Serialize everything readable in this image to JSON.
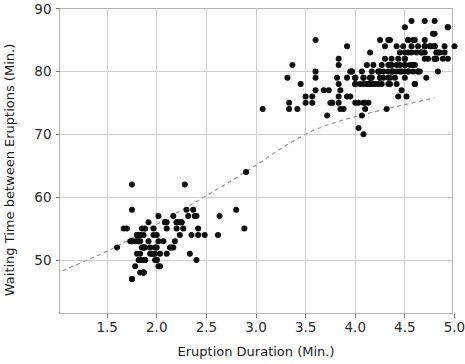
{
  "chart_data": {
    "type": "scatter",
    "title": "",
    "xlabel": "Eruption Duration (Min.)",
    "ylabel": "Waiting Time between Eruptions (Min.)",
    "xlim": [
      1.02,
      4.98
    ],
    "ylim": [
      41.5,
      90
    ],
    "xticks": [
      1.5,
      2.0,
      2.5,
      3.0,
      3.5,
      4.0,
      4.5,
      5.0
    ],
    "xticklabels": [
      "1.5",
      "2.0",
      "2.5",
      "3.0",
      "3.5",
      "4.0",
      "4.5",
      "5.0"
    ],
    "yticks": [
      50,
      60,
      70,
      80,
      90
    ],
    "yticklabels": [
      "50",
      "60",
      "70",
      "80",
      "90"
    ],
    "grid": true,
    "legend": false,
    "legend_position": "none",
    "marker": "filled-circle",
    "marker_color": "#0d0d0d",
    "marker_size": 3.0,
    "n_points": 272,
    "series": [
      {
        "name": "Old Faithful eruptions",
        "x": [
          3.6,
          1.8,
          3.333,
          2.283,
          4.533,
          2.883,
          4.7,
          3.6,
          1.95,
          4.35,
          1.833,
          3.917,
          4.2,
          1.75,
          4.7,
          2.167,
          1.75,
          4.8,
          1.6,
          4.25,
          1.8,
          1.75,
          3.45,
          3.067,
          4.533,
          3.6,
          1.967,
          4.083,
          3.85,
          4.433,
          4.3,
          4.467,
          3.367,
          4.033,
          3.833,
          2.017,
          1.867,
          4.833,
          1.833,
          4.783,
          4.35,
          1.883,
          4.567,
          1.75,
          4.533,
          3.317,
          3.833,
          2.1,
          4.633,
          2.0,
          4.8,
          4.716,
          1.833,
          4.833,
          1.733,
          4.883,
          3.717,
          1.667,
          4.567,
          4.317,
          2.233,
          4.5,
          1.75,
          4.8,
          1.817,
          4.4,
          4.167,
          4.7,
          2.067,
          4.7,
          4.033,
          1.967,
          4.5,
          4.0,
          1.983,
          5.067,
          2.017,
          4.567,
          3.883,
          3.6,
          4.133,
          4.333,
          4.1,
          2.633,
          4.067,
          4.933,
          3.95,
          4.517,
          2.167,
          4.0,
          2.2,
          4.333,
          1.867,
          4.817,
          1.833,
          4.3,
          4.667,
          3.75,
          1.867,
          4.9,
          2.483,
          4.367,
          2.1,
          4.5,
          4.05,
          1.867,
          4.7,
          1.783,
          4.85,
          3.683,
          4.733,
          2.3,
          4.9,
          4.417,
          1.7,
          4.633,
          2.317,
          4.6,
          1.817,
          4.417,
          2.617,
          4.067,
          4.25,
          1.967,
          4.6,
          3.767,
          1.917,
          4.5,
          2.267,
          4.65,
          1.867,
          4.167,
          2.8,
          4.333,
          1.833,
          4.383,
          1.883,
          4.933,
          2.033,
          3.733,
          4.233,
          2.233,
          4.533,
          4.817,
          4.333,
          1.983,
          4.633,
          2.017,
          5.1,
          1.8,
          5.033,
          4.0,
          2.4,
          4.6,
          3.567,
          4.0,
          4.5,
          4.083,
          1.8,
          3.967,
          2.2,
          4.15,
          2.0,
          3.833,
          3.5,
          4.583,
          2.367,
          5.0,
          1.933,
          4.617,
          1.917,
          2.083,
          4.583,
          3.333,
          4.167,
          4.333,
          4.5,
          2.417,
          4.0,
          4.167,
          1.883,
          4.583,
          4.25,
          3.767,
          2.033,
          4.433,
          4.083,
          1.833,
          4.417,
          2.183,
          4.8,
          1.833,
          4.8,
          4.1,
          3.966,
          4.233,
          3.5,
          4.366,
          2.25,
          4.667,
          2.1,
          4.35,
          4.133,
          1.867,
          4.6,
          1.783,
          4.367,
          3.85,
          1.933,
          4.5,
          2.383,
          4.7,
          1.867,
          3.833,
          3.417,
          4.233,
          2.4,
          4.8,
          2.0,
          4.15,
          1.867,
          4.267,
          1.75,
          4.483,
          4.0,
          4.117,
          4.083,
          4.267,
          3.917,
          4.55,
          4.083,
          2.417,
          4.183,
          2.217,
          4.45,
          1.883,
          1.85,
          4.283,
          3.95,
          2.333,
          4.15,
          2.35,
          4.933,
          2.9,
          4.583,
          3.833,
          2.083,
          4.367,
          2.133,
          4.35,
          2.2,
          4.45,
          3.567,
          4.5,
          4.15,
          3.817,
          3.917,
          4.45,
          2.0,
          4.283,
          4.767,
          4.533,
          1.85,
          4.25,
          1.983,
          2.25,
          4.75,
          4.117,
          2.15,
          4.417,
          1.817,
          4.467
        ],
        "y": [
          79,
          54,
          74,
          62,
          85,
          55,
          88,
          85,
          51,
          85,
          54,
          84,
          78,
          47,
          83,
          52,
          62,
          84,
          52,
          79,
          51,
          47,
          78,
          74,
          85,
          77,
          51,
          70,
          77,
          76,
          84,
          77,
          81,
          71,
          76,
          49,
          54,
          80,
          50,
          86,
          78,
          50,
          84,
          58,
          83,
          79,
          81,
          56,
          80,
          50,
          88,
          79,
          54,
          83,
          53,
          82,
          73,
          55,
          83,
          74,
          56,
          82,
          53,
          86,
          50,
          79,
          80,
          84,
          53,
          82,
          75,
          55,
          79,
          78,
          52,
          88,
          57,
          88,
          74,
          80,
          75,
          81,
          74,
          57,
          73,
          87,
          80,
          76,
          57,
          75,
          56,
          85,
          48,
          82,
          50,
          82,
          83,
          75,
          50,
          84,
          54,
          81,
          51,
          80,
          78,
          52,
          85,
          49,
          83,
          77,
          82,
          58,
          83,
          78,
          55,
          80,
          57,
          81,
          54,
          80,
          54,
          80,
          85,
          54,
          78,
          75,
          56,
          87,
          55,
          80,
          52,
          79,
          58,
          79,
          51,
          80,
          55,
          82,
          49,
          77,
          80,
          54,
          80,
          83,
          78,
          51,
          84,
          53,
          86,
          53,
          85,
          79,
          57,
          78,
          76,
          79,
          83,
          78,
          54,
          80,
          56,
          83,
          52,
          75,
          76,
          81,
          58,
          84,
          52,
          83,
          53,
          56,
          80,
          75,
          78,
          80,
          81,
          54,
          79,
          78,
          52,
          85,
          79,
          75,
          51,
          82,
          79,
          53,
          84,
          53,
          82,
          48,
          84,
          75,
          80,
          78,
          75,
          82,
          56,
          83,
          55,
          79,
          78,
          52,
          85,
          53,
          80,
          74,
          51,
          82,
          57,
          84,
          48,
          82,
          74,
          80,
          50,
          82,
          54,
          79,
          48,
          81,
          53,
          84,
          78,
          81,
          75,
          78,
          76,
          81,
          79,
          55,
          81,
          56,
          81,
          50,
          52,
          79,
          76,
          51,
          79,
          54,
          87,
          64,
          81,
          78,
          56,
          80,
          52,
          81,
          55,
          80,
          75,
          81,
          78,
          79,
          79,
          83,
          50,
          80,
          84,
          80,
          55,
          80,
          50,
          56,
          84,
          78,
          52,
          81,
          53,
          80
        ]
      }
    ],
    "trend": {
      "label": "smoothed trend",
      "style": "dashed",
      "color": "#9a9a9a",
      "points": [
        [
          1.05,
          48.3
        ],
        [
          1.3,
          50.0
        ],
        [
          1.55,
          51.8
        ],
        [
          1.8,
          53.9
        ],
        [
          2.05,
          56.1
        ],
        [
          2.3,
          58.4
        ],
        [
          2.55,
          60.7
        ],
        [
          2.8,
          63.1
        ],
        [
          3.05,
          65.6
        ],
        [
          3.3,
          68.2
        ],
        [
          3.55,
          70.4
        ],
        [
          3.8,
          71.9
        ],
        [
          4.05,
          73.0
        ],
        [
          4.3,
          74.0
        ],
        [
          4.55,
          74.9
        ],
        [
          4.8,
          75.8
        ]
      ]
    }
  }
}
